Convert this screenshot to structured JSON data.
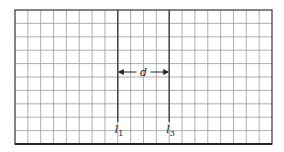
{
  "diagram": {
    "grid": {
      "left": 15,
      "top": 10,
      "right": 272,
      "bottom": 144,
      "columns": 20,
      "rows": 10,
      "grid_color": "#9a9a9a",
      "border_color": "#333333"
    },
    "wires": [
      {
        "label": "l",
        "subscript": "1",
        "column": 8
      },
      {
        "label": "l",
        "subscript": "3",
        "column": 12
      }
    ],
    "separation": {
      "label": "d",
      "row_y": 72
    }
  }
}
